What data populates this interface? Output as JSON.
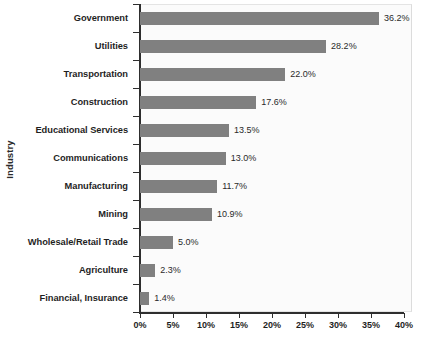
{
  "chart_data": {
    "type": "bar",
    "orientation": "horizontal",
    "title": "",
    "xlabel": "",
    "ylabel": "Industry",
    "xlim": [
      0,
      40
    ],
    "xticks": [
      "0%",
      "5%",
      "10%",
      "15%",
      "20%",
      "25%",
      "30%",
      "35%",
      "40%"
    ],
    "xtick_values": [
      0,
      5,
      10,
      15,
      20,
      25,
      30,
      35,
      40
    ],
    "grid": false,
    "legend": false,
    "bar_color": "#808080",
    "categories": [
      "Government",
      "Utilities",
      "Transportation",
      "Construction",
      "Educational Services",
      "Communications",
      "Manufacturing",
      "Mining",
      "Wholesale/Retail Trade",
      "Agriculture",
      "Financial, Insurance"
    ],
    "values": [
      36.2,
      28.2,
      22.0,
      17.6,
      13.5,
      13.0,
      11.7,
      10.9,
      5.0,
      2.3,
      1.4
    ],
    "value_labels": [
      "36.2%",
      "28.2%",
      "22.0%",
      "17.6%",
      "13.5%",
      "13.0%",
      "11.7%",
      "10.9%",
      "5.0%",
      "2.3%",
      "1.4%"
    ]
  }
}
